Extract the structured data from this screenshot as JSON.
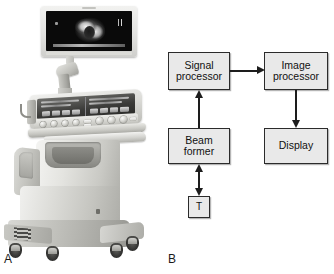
{
  "figure": {
    "panels": [
      {
        "id": "A",
        "label": "A",
        "type": "photograph",
        "caption_text": "A",
        "content_description": "ultrasound-scanner-photograph"
      },
      {
        "id": "B",
        "label": "B",
        "type": "block-diagram",
        "caption_text": "B"
      }
    ]
  },
  "panel_a": {
    "label": "A",
    "monitor": {
      "name": "display-monitor",
      "screen_content": "grayscale-ultrasound-image"
    },
    "console": {
      "name": "control-console",
      "touch_panel": "touchscreen-panel",
      "keyboard": "control-keypad"
    },
    "cart": {
      "name": "mobile-cart",
      "casters": 4
    }
  },
  "panel_b": {
    "label": "B",
    "blocks": [
      {
        "id": "signal-processor",
        "line1": "Signal",
        "line2": "processor"
      },
      {
        "id": "image-processor",
        "line1": "Image",
        "line2": "processor"
      },
      {
        "id": "beam-former",
        "line1": "Beam",
        "line2": "former"
      },
      {
        "id": "display",
        "line1": "Display",
        "line2": ""
      },
      {
        "id": "transducer",
        "line1": "T",
        "line2": ""
      }
    ],
    "connections": [
      {
        "id": "signal-to-image",
        "from": "signal-processor",
        "to": "image-processor",
        "direction": "right",
        "double_headed": false
      },
      {
        "id": "beam-to-signal",
        "from": "beam-former",
        "to": "signal-processor",
        "direction": "up",
        "double_headed": false
      },
      {
        "id": "image-to-display",
        "from": "image-processor",
        "to": "display",
        "direction": "down",
        "double_headed": false
      },
      {
        "id": "beam-to-transducer",
        "from": "beam-former",
        "to": "transducer",
        "direction": "both",
        "double_headed": true
      }
    ],
    "colors": {
      "block_fill": "#e9e9e9",
      "block_border": "#2b2b2b",
      "arrow": "#1d1d1d",
      "text": "#111111",
      "background": "#ffffff"
    }
  }
}
